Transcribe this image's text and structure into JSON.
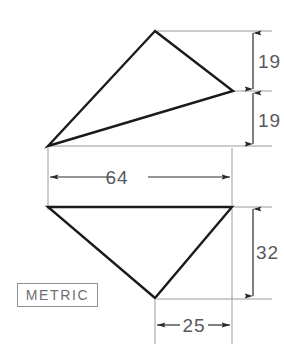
{
  "drawing": {
    "title": "Two-triangle orthographic dimensioned sketch",
    "units_note": "METRIC",
    "background_color": "#ffffff",
    "outline_color": "#1a1a1a",
    "dimension_color": "#58595b",
    "note_color": "#6d6e70",
    "shapes": [
      {
        "name": "upper-triangle",
        "type": "triangle",
        "points": "155,31 233,91 48,146"
      },
      {
        "name": "lower-triangle",
        "type": "triangle",
        "points": "48,207 232,207 155,298"
      }
    ],
    "dimensions": [
      {
        "name": "upper-height-19",
        "label": "19",
        "orientation": "vertical",
        "value": 19,
        "from": 31,
        "to": 91,
        "line_x": 253,
        "text_x": 258,
        "text_y": 68
      },
      {
        "name": "lower-height-19",
        "label": "19",
        "orientation": "vertical",
        "value": 19,
        "from": 91,
        "to": 146,
        "line_x": 253,
        "text_x": 258,
        "text_y": 127
      },
      {
        "name": "overall-width-64",
        "label": "64",
        "orientation": "horizontal",
        "value": 64,
        "from": 48,
        "to": 232,
        "line_y": 177,
        "text_x": 127,
        "text_y": 184
      },
      {
        "name": "lower-height-32",
        "label": "32",
        "orientation": "vertical",
        "value": 32,
        "from": 207,
        "to": 298,
        "line_x": 253,
        "text_x": 258,
        "text_y": 259
      },
      {
        "name": "apex-offset-25",
        "label": "25",
        "orientation": "horizontal",
        "value": 25,
        "from": 155,
        "to": 232,
        "line_y": 325,
        "text_x": 193,
        "text_y": 332
      }
    ]
  }
}
